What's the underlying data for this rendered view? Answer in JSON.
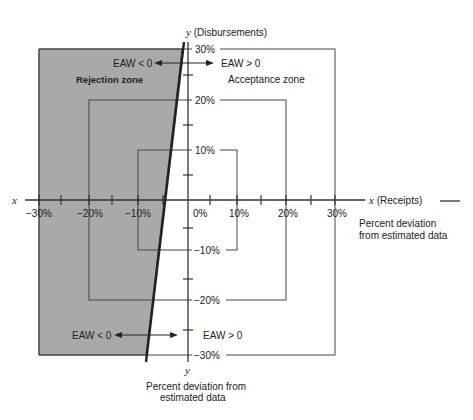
{
  "diagram": {
    "colors": {
      "rejection_fill": "#a9a9a9",
      "lines": "#333333",
      "background": "#ffffff"
    },
    "axes": {
      "x_label_left": "x",
      "x_label_right": "x (Receipts)",
      "y_label_top": "y (Disbursements)",
      "y_label_bottom": "y",
      "x_ticks": [
        "−30%",
        "−20%",
        "−10%",
        "0%",
        "10%",
        "20%",
        "30%"
      ],
      "y_ticks": [
        "30%",
        "20%",
        "10%",
        "−10%",
        "−20%",
        "−30%"
      ]
    },
    "zones": {
      "rejection": "Rejection zone",
      "acceptance": "Acceptance zone"
    },
    "annotations": {
      "eaw_neg_top": "EAW < 0",
      "eaw_pos_top": "EAW > 0",
      "eaw_neg_bottom": "EAW < 0",
      "eaw_pos_bottom": "EAW > 0",
      "x_caption_line1": "Percent deviation",
      "x_caption_line2": "from estimated data",
      "y_caption_line1": "Percent deviation from",
      "y_caption_line2": "estimated data"
    },
    "squares": [
      {
        "name": "10% boundary",
        "half_width_pct": 10
      },
      {
        "name": "20% boundary",
        "half_width_pct": 20
      },
      {
        "name": "30% boundary",
        "half_width_pct": 30
      }
    ]
  }
}
